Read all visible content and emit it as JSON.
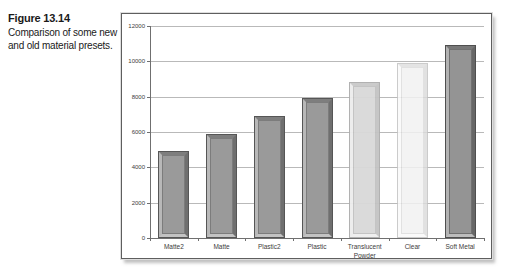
{
  "figure": {
    "label": "Figure 13.14",
    "caption": "Comparison of some new and old material presets."
  },
  "chart_data": {
    "type": "bar",
    "title": "Comparison of some new and old material presets",
    "categories": [
      "Matte2",
      "Matte",
      "Plastic2",
      "Plastic",
      "Translucent Powder",
      "Clear",
      "Soft Metal"
    ],
    "values": [
      4900,
      5900,
      6900,
      7900,
      8850,
      9900,
      10900
    ],
    "xlabel": "",
    "ylabel": "",
    "ylim": [
      0,
      12000
    ],
    "yticks": [
      0,
      2000,
      4000,
      6000,
      8000,
      10000,
      12000
    ],
    "grid": true,
    "legend": "none",
    "grid_color": "#b9b9b9",
    "axis_color": "#6f6f6f",
    "bar_styles": [
      {
        "face": "#9a9a9a",
        "bevel_top": "#7e7e7e",
        "bevel_left": "#b8b8b8",
        "bevel_right": "#6f6f6f",
        "bevel_bottom": "#c3c3c3",
        "outline": "#565656",
        "inner_line": "rgba(70,70,70,0.35)",
        "opacity": 1
      },
      {
        "face": "#9a9a9a",
        "bevel_top": "#7e7e7e",
        "bevel_left": "#b8b8b8",
        "bevel_right": "#6f6f6f",
        "bevel_bottom": "#c3c3c3",
        "outline": "#565656",
        "inner_line": "rgba(70,70,70,0.35)",
        "opacity": 1
      },
      {
        "face": "#9a9a9a",
        "bevel_top": "#7e7e7e",
        "bevel_left": "#b8b8b8",
        "bevel_right": "#6f6f6f",
        "bevel_bottom": "#c3c3c3",
        "outline": "#565656",
        "inner_line": "rgba(70,70,70,0.35)",
        "opacity": 1
      },
      {
        "face": "#9a9a9a",
        "bevel_top": "#7e7e7e",
        "bevel_left": "#b8b8b8",
        "bevel_right": "#6f6f6f",
        "bevel_bottom": "#c3c3c3",
        "outline": "#565656",
        "inner_line": "rgba(70,70,70,0.35)",
        "opacity": 1
      },
      {
        "face": "#d9d9d9",
        "bevel_top": "#c9c9c9",
        "bevel_left": "#ededed",
        "bevel_right": "#c4c4c4",
        "bevel_bottom": "#efefef",
        "outline": "#adadad",
        "inner_line": "rgba(150,150,150,0.35)",
        "opacity": 0.95
      },
      {
        "face": "#f2f2f2",
        "bevel_top": "#e0e0e0",
        "bevel_left": "#fafafa",
        "bevel_right": "#dcdcdc",
        "bevel_bottom": "#fafafa",
        "outline": "#c3c3c3",
        "inner_line": "rgba(170,170,170,0.30)",
        "opacity": 0.85
      },
      {
        "face": "#949494",
        "bevel_top": "#787878",
        "bevel_left": "#b2b2b2",
        "bevel_right": "#676767",
        "bevel_bottom": "#bdbdbd",
        "outline": "#4f4f4f",
        "inner_line": "rgba(60,60,60,0.40)",
        "opacity": 1
      }
    ]
  }
}
